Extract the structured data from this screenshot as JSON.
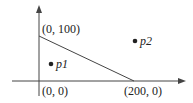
{
  "diagram": {
    "type": "coordinate-plot",
    "axes": {
      "x_arrow": true,
      "y_arrow": true
    },
    "segment": {
      "from": "(0, 100)",
      "to": "(200, 0)"
    },
    "labels": {
      "top_vertex": "(0, 100)",
      "origin": "(0, 0)",
      "right_vertex": "(200, 0)"
    },
    "points": [
      {
        "name": "p1",
        "label": "p1"
      },
      {
        "name": "p2",
        "label": "p2"
      }
    ],
    "colors": {
      "stroke": "#333333",
      "text": "#222222"
    }
  }
}
